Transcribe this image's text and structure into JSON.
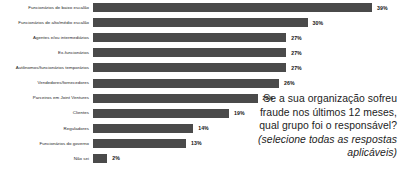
{
  "chart_data": {
    "type": "bar",
    "orientation": "horizontal",
    "title": "",
    "subtitle": "",
    "xlabel": "",
    "ylabel": "",
    "xlim": [
      0,
      39
    ],
    "grid": false,
    "legend": null,
    "value_suffix": "%",
    "bar_color": "#4a4a4a",
    "categories": [
      "Funcionários de baixo escalão",
      "Funcionários de alto/médio escalão",
      "Agentes e/ou intermediários",
      "Ex-funcionários",
      "Autônomos/funcionários temporários",
      "Vendedores/fornecedores",
      "Parceiros em Joint Ventures",
      "Clientes",
      "Reguladores",
      "Funcionários do governo",
      "Não sei"
    ],
    "values": [
      39,
      30,
      27,
      27,
      27,
      26,
      23,
      19,
      14,
      13,
      2
    ],
    "data_labels": [
      "39%",
      "30%",
      "27%",
      "27%",
      "27%",
      "26%",
      "23%",
      "19%",
      "14%",
      "13%",
      "2%"
    ],
    "bars": [
      {
        "label": "Funcionários de baixo escalão",
        "value": 39,
        "display": "39%"
      },
      {
        "label": "Funcionários de alto/médio escalão",
        "value": 30,
        "display": "30%"
      },
      {
        "label": "Agentes e/ou intermediários",
        "value": 27,
        "display": "27%"
      },
      {
        "label": "Ex-funcionários",
        "value": 27,
        "display": "27%"
      },
      {
        "label": "Autônomos/funcionários temporários",
        "value": 27,
        "display": "27%"
      },
      {
        "label": "Vendedores/fornecedores",
        "value": 26,
        "display": "26%"
      },
      {
        "label": "Parceiros em Joint Ventures",
        "value": 23,
        "display": "23%"
      },
      {
        "label": "Clientes",
        "value": 19,
        "display": "19%"
      },
      {
        "label": "Reguladores",
        "value": 14,
        "display": "14%"
      },
      {
        "label": "Funcionários do governo",
        "value": 13,
        "display": "13%"
      },
      {
        "label": "Não sei",
        "value": 2,
        "display": "2%"
      }
    ],
    "annotation": {
      "question": "Se a sua organização sofreu fraude nos últimos 12 meses, qual grupo foi o responsável?",
      "instruction": "(selecione todas as respostas aplicáveis)"
    }
  }
}
